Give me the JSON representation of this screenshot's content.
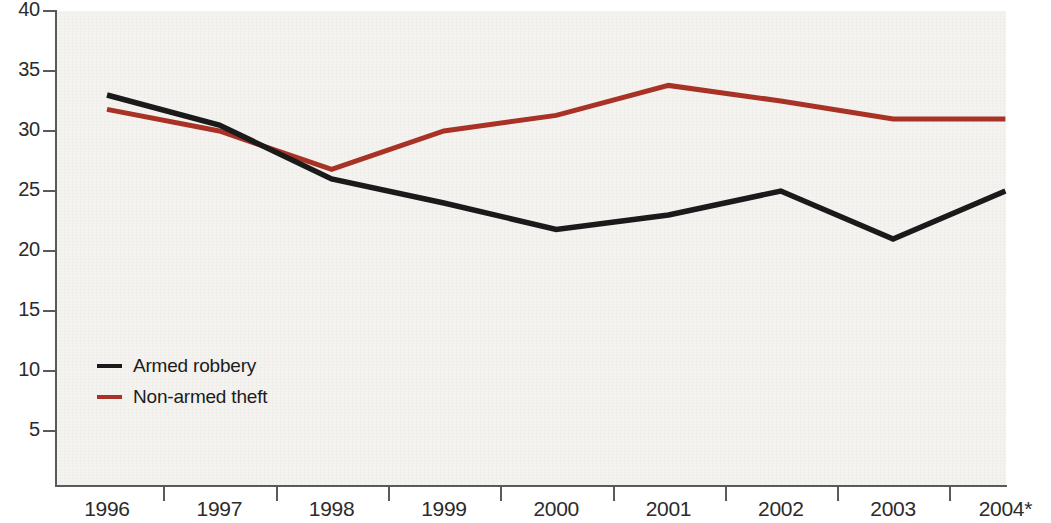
{
  "chart_data": {
    "type": "line",
    "title": "",
    "subtitle": "",
    "xlabel": "",
    "ylabel": "",
    "categories": [
      "1996",
      "1997",
      "1998",
      "1999",
      "2000",
      "2001",
      "2002",
      "2003",
      "2004*"
    ],
    "series": [
      {
        "name": "Armed robbery",
        "color": "#1a1a1a",
        "values": [
          33,
          30.5,
          26,
          24,
          21.8,
          23,
          25,
          21,
          25
        ]
      },
      {
        "name": "Non-armed theft",
        "color": "#a93226",
        "values": [
          31.8,
          30,
          26.8,
          30,
          31.3,
          33.8,
          32.5,
          31,
          31
        ]
      }
    ],
    "ylim": [
      0,
      40
    ],
    "xlim": [
      "1996",
      "2004*"
    ],
    "y_ticks": [
      40,
      35,
      30,
      25,
      20,
      15,
      10,
      5
    ],
    "y_tick_labels": [
      "40",
      "35",
      "30",
      "25",
      "20",
      "15",
      "10",
      "5"
    ],
    "grid": false,
    "legend_position": "inside-lower-left",
    "plot_background": "#f5f3f0",
    "axis_color": "#5a5a5a",
    "text_color": "#2b2b2b",
    "annotations": [
      "2004 value is marked with an asterisk"
    ]
  }
}
